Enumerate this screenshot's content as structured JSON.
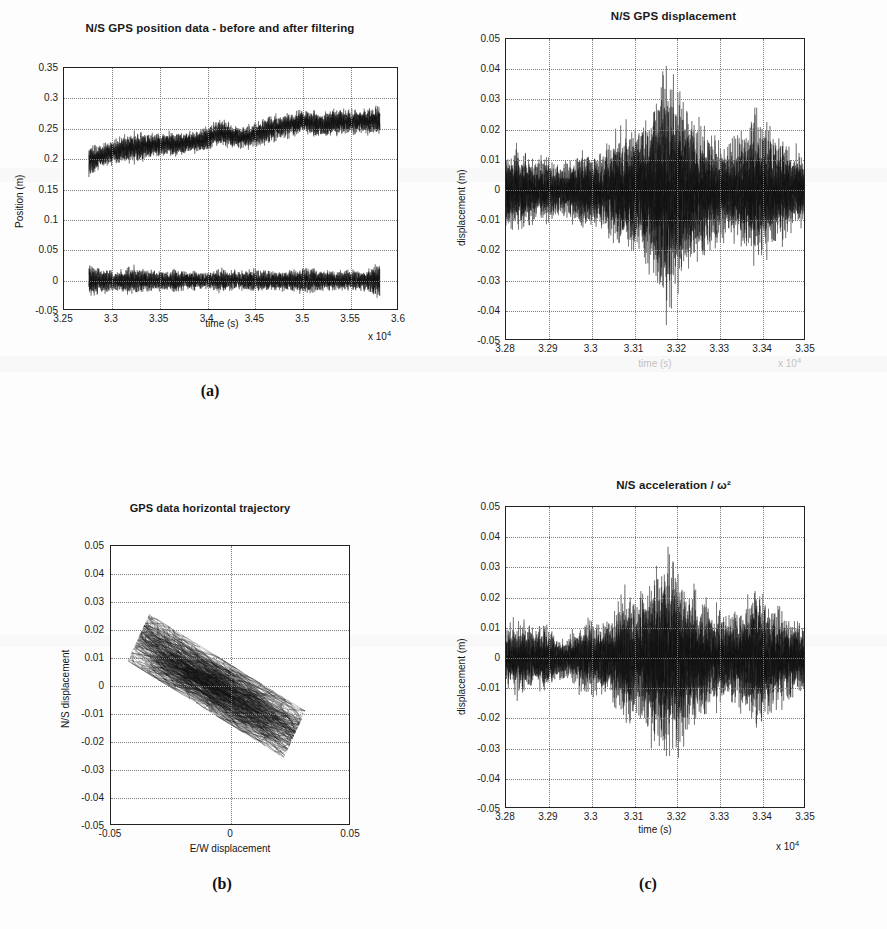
{
  "figure": {
    "background_color": "#fdfdfd",
    "trace_color": "#111111",
    "grid_color": "#7d7d7d",
    "axis_color": "#222222"
  },
  "panels": [
    {
      "key": "a",
      "subfig_label": "(a)",
      "title": "N/S GPS position data - before and after filtering",
      "xlabel": "time (s)",
      "ylabel": "Position (m)",
      "x_exponent": "x 10",
      "x_exponent_sup": "4",
      "xticks": [
        "3.25",
        "3.3",
        "3.35",
        "3.4",
        "3.45",
        "3.5",
        "3.55",
        "3.6"
      ],
      "yticks": [
        "0.35",
        "0.3",
        "0.25",
        "0.2",
        "0.15",
        "0.1",
        "0.05",
        "0",
        "-0.05"
      ]
    },
    {
      "key": "c",
      "subfig_label": "",
      "title": "N/S GPS displacement",
      "xlabel": "time (s)",
      "ylabel": "displacement (m)",
      "x_exponent": "x 10",
      "x_exponent_sup": "4",
      "xticks": [
        "3.28",
        "3.29",
        "3.3",
        "3.31",
        "3.32",
        "3.33",
        "3.34",
        "3.35"
      ],
      "yticks": [
        "0.05",
        "0.04",
        "0.03",
        "0.02",
        "0.01",
        "0",
        "-0.01",
        "-0.02",
        "-0.03",
        "-0.04",
        "-0.05"
      ]
    },
    {
      "key": "b",
      "subfig_label": "(b)",
      "title": "GPS data horizontal trajectory",
      "xlabel": "E/W displacement",
      "ylabel": "N/S displacement",
      "x_exponent": "",
      "x_exponent_sup": "",
      "xticks": [
        "-0.05",
        "0",
        "0.05"
      ],
      "yticks": [
        "0.05",
        "0.04",
        "0.03",
        "0.02",
        "0.01",
        "0",
        "-0.01",
        "-0.02",
        "-0.03",
        "-0.04",
        "-0.05"
      ]
    },
    {
      "key": "d",
      "subfig_label": "(c)",
      "title": "N/S acceleration / ω²",
      "xlabel": "time (s)",
      "ylabel": "displacement (m)",
      "x_exponent": "x 10",
      "x_exponent_sup": "4",
      "xticks": [
        "3.28",
        "3.29",
        "3.3",
        "3.31",
        "3.32",
        "3.33",
        "3.34",
        "3.35"
      ],
      "yticks": [
        "0.05",
        "0.04",
        "0.03",
        "0.02",
        "0.01",
        "0",
        "-0.01",
        "-0.02",
        "-0.03",
        "-0.04",
        "-0.05"
      ]
    }
  ],
  "chart_data": [
    {
      "id": "panel-a",
      "type": "line",
      "title": "N/S GPS position data - before and after filtering",
      "xlabel": "time (s)",
      "ylabel": "Position (m)",
      "x_scale_note": "x 10^4",
      "xlim": [
        32500,
        36000
      ],
      "ylim": [
        -0.05,
        0.35
      ],
      "xticks": [
        32500,
        33000,
        33500,
        34000,
        34500,
        35000,
        35500,
        36000
      ],
      "yticks": [
        -0.05,
        0,
        0.05,
        0.1,
        0.15,
        0.2,
        0.25,
        0.3,
        0.35
      ],
      "grid": true,
      "legend": "none",
      "series": [
        {
          "name": "unfiltered N/S position",
          "description": "noisy band drifting upward from ~0.20 m to ~0.26 m across the record, with peak-to-peak noise of about 0.05 m",
          "x": [
            32760,
            32850,
            32950,
            33050,
            33150,
            33250,
            33350,
            33450,
            33550,
            33650,
            33750,
            33850,
            33950,
            34050,
            34150,
            34250,
            34350,
            34450,
            34550,
            34650,
            34750,
            34850,
            34950,
            35050,
            35150,
            35250,
            35350,
            35450,
            35550,
            35700,
            35800
          ],
          "mean": [
            0.196,
            0.203,
            0.209,
            0.213,
            0.218,
            0.219,
            0.222,
            0.223,
            0.225,
            0.224,
            0.226,
            0.229,
            0.232,
            0.24,
            0.243,
            0.238,
            0.236,
            0.24,
            0.246,
            0.25,
            0.254,
            0.258,
            0.262,
            0.259,
            0.257,
            0.26,
            0.262,
            0.261,
            0.263,
            0.262,
            0.264
          ],
          "band_halfwidth": [
            0.03,
            0.022,
            0.02,
            0.024,
            0.026,
            0.027,
            0.022,
            0.02,
            0.021,
            0.023,
            0.019,
            0.021,
            0.022,
            0.023,
            0.024,
            0.02,
            0.021,
            0.023,
            0.025,
            0.026,
            0.024,
            0.022,
            0.021,
            0.023,
            0.024,
            0.023,
            0.025,
            0.022,
            0.023,
            0.024,
            0.026
          ]
        },
        {
          "name": "filtered N/S position",
          "description": "zero-mean band centred on 0 m with peak-to-peak amplitude about 0.05 m",
          "x": [
            32760,
            32900,
            33050,
            33200,
            33350,
            33500,
            33650,
            33800,
            33950,
            34100,
            34250,
            34400,
            34550,
            34700,
            34850,
            35000,
            35150,
            35300,
            35450,
            35600,
            35800
          ],
          "mean": [
            0.0,
            0.0,
            0.0,
            0.0,
            0.0,
            0.0,
            0.0,
            0.0,
            0.0,
            0.0,
            0.0,
            0.0,
            0.0,
            0.0,
            0.0,
            0.0,
            0.0,
            0.0,
            0.0,
            0.0,
            0.0
          ],
          "band_halfwidth": [
            0.03,
            0.022,
            0.018,
            0.025,
            0.019,
            0.018,
            0.021,
            0.017,
            0.016,
            0.021,
            0.018,
            0.02,
            0.019,
            0.017,
            0.022,
            0.024,
            0.019,
            0.018,
            0.02,
            0.019,
            0.031
          ]
        }
      ]
    },
    {
      "id": "panel-c-top-right",
      "type": "line",
      "title": "N/S GPS displacement",
      "xlabel": "time (s)",
      "ylabel": "displacement (m)",
      "x_scale_note": "x 10^4",
      "xlim": [
        32800,
        33500
      ],
      "ylim": [
        -0.05,
        0.05
      ],
      "xticks": [
        32800,
        32900,
        33000,
        33100,
        33200,
        33300,
        33400,
        33500
      ],
      "yticks": [
        -0.05,
        -0.04,
        -0.03,
        -0.02,
        -0.01,
        0,
        0.01,
        0.02,
        0.03,
        0.04,
        0.05
      ],
      "grid": true,
      "legend": "none",
      "series": [
        {
          "name": "N/S GPS displacement",
          "description": "zero-mean seismic record; quiet ambient level of about +/-0.012 m rising to a main burst near t = 33240 s reaching +0.042 m and -0.041 m, with a secondary burst near t = 33400 s reaching about +/-0.028 m",
          "x": [
            32800,
            32830,
            32860,
            32890,
            32920,
            32950,
            32980,
            33010,
            33040,
            33070,
            33100,
            33130,
            33160,
            33190,
            33210,
            33230,
            33240,
            33250,
            33270,
            33290,
            33310,
            33330,
            33350,
            33370,
            33390,
            33405,
            33420,
            33440,
            33460,
            33480,
            33500
          ],
          "envelope": [
            0.013,
            0.016,
            0.014,
            0.011,
            0.013,
            0.009,
            0.01,
            0.012,
            0.015,
            0.013,
            0.016,
            0.02,
            0.024,
            0.023,
            0.028,
            0.036,
            0.042,
            0.038,
            0.03,
            0.026,
            0.023,
            0.02,
            0.018,
            0.019,
            0.022,
            0.028,
            0.024,
            0.02,
            0.017,
            0.015,
            0.012
          ]
        }
      ]
    },
    {
      "id": "panel-b",
      "type": "scatter",
      "title": "GPS data horizontal trajectory",
      "xlabel": "E/W displacement",
      "ylabel": "N/S displacement",
      "xlim": [
        -0.05,
        0.05
      ],
      "ylim": [
        -0.05,
        0.05
      ],
      "xticks": [
        -0.05,
        0,
        0.05
      ],
      "yticks": [
        -0.05,
        -0.04,
        -0.03,
        -0.02,
        -0.01,
        0,
        0.01,
        0.02,
        0.03,
        0.04,
        0.05
      ],
      "grid": true,
      "legend": "none",
      "series": [
        {
          "name": "horizontal trajectory",
          "description": "dense connected trajectory forming an elongated cloud oriented from upper-left to lower-right; major axis runs from about (-0.037, 0.019) to (0.022, -0.020), major semi-axis about 0.035, minor semi-axis about 0.008, correlation strongly negative",
          "centre": [
            -0.006,
            0.0
          ],
          "major_axis_angle_deg": -28,
          "major_semi_axis": 0.035,
          "minor_semi_axis": 0.009,
          "n_points_approx": 4000
        }
      ]
    },
    {
      "id": "panel-d-bottom-right",
      "type": "line",
      "title": "N/S acceleration / ω²",
      "xlabel": "time (s)",
      "ylabel": "displacement (m)",
      "x_scale_note": "x 10^4",
      "xlim": [
        32800,
        33500
      ],
      "ylim": [
        -0.05,
        0.05
      ],
      "xticks": [
        32800,
        32900,
        33000,
        33100,
        33200,
        33300,
        33400,
        33500
      ],
      "yticks": [
        -0.05,
        -0.04,
        -0.03,
        -0.02,
        -0.01,
        0,
        0.01,
        0.02,
        0.03,
        0.04,
        0.05
      ],
      "grid": true,
      "legend": "none",
      "series": [
        {
          "name": "N/S acceleration divided by omega squared",
          "description": "double-integrated accelerometer estimate of displacement; matches panel (c) in shape but with a slightly smaller main burst peaking at about +0.038 m and -0.037 m near t = 33235 s, quiet level about +/-0.011 m",
          "x": [
            32800,
            32830,
            32860,
            32890,
            32920,
            32950,
            32980,
            33010,
            33040,
            33070,
            33100,
            33130,
            33160,
            33185,
            33205,
            33225,
            33235,
            33250,
            33265,
            33285,
            33305,
            33325,
            33345,
            33365,
            33385,
            33400,
            33415,
            33435,
            33455,
            33475,
            33500
          ],
          "envelope": [
            0.01,
            0.014,
            0.013,
            0.01,
            0.014,
            0.008,
            0.008,
            0.011,
            0.013,
            0.012,
            0.015,
            0.018,
            0.024,
            0.021,
            0.025,
            0.032,
            0.038,
            0.034,
            0.027,
            0.023,
            0.021,
            0.018,
            0.017,
            0.018,
            0.021,
            0.027,
            0.023,
            0.019,
            0.016,
            0.014,
            0.011
          ]
        }
      ]
    }
  ]
}
